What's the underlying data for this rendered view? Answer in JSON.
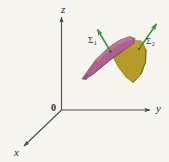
{
  "figure": {
    "background_color": "#f7f5ef",
    "axes": {
      "z_label": "z",
      "y_label": "y",
      "x_label": "x",
      "origin_label": "0",
      "axis_color": "#4a4a4a"
    },
    "surfaces": [
      {
        "name": "sigma-1",
        "symbol": "Σ",
        "subscript": "1",
        "fill_color": "#b0608f",
        "stroke_color": "#7d3f63"
      },
      {
        "name": "sigma-2",
        "symbol": "Σ",
        "subscript": "2",
        "fill_color": "#b79b2a",
        "stroke_color": "#7e6a18"
      }
    ],
    "normal_vectors": {
      "color": "#3f8f3f",
      "count": "2"
    }
  }
}
